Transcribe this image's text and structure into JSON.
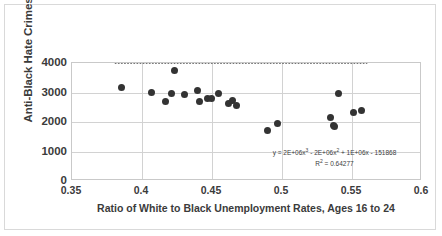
{
  "chart_data": {
    "type": "scatter",
    "title": "",
    "xlabel": "Ratio of White to Black Unemployment Rates, Ages 16 to 24",
    "ylabel": "Anti-Black Hate Crimes",
    "xlim": [
      0.35,
      0.6
    ],
    "ylim": [
      0,
      4000
    ],
    "xticks": [
      "0.35",
      "0.4",
      "0.45",
      "0.5",
      "0.55",
      "0.6"
    ],
    "xtick_values": [
      0.35,
      0.4,
      0.45,
      0.5,
      0.55,
      0.6
    ],
    "yticks": [
      "0",
      "1000",
      "2000",
      "3000",
      "4000"
    ],
    "ytick_values": [
      0,
      1000,
      2000,
      3000,
      4000
    ],
    "grid": true,
    "legend": "none",
    "marker_color": "#333333",
    "trendline_color": "#404040",
    "trendline_style": "dotted",
    "points": [
      {
        "x": 0.385,
        "y": 3160
      },
      {
        "x": 0.407,
        "y": 3000
      },
      {
        "x": 0.417,
        "y": 2690
      },
      {
        "x": 0.421,
        "y": 2950
      },
      {
        "x": 0.4235,
        "y": 3730
      },
      {
        "x": 0.43,
        "y": 2945
      },
      {
        "x": 0.4395,
        "y": 3060
      },
      {
        "x": 0.441,
        "y": 2705
      },
      {
        "x": 0.4465,
        "y": 2810
      },
      {
        "x": 0.4495,
        "y": 2800
      },
      {
        "x": 0.4545,
        "y": 2980
      },
      {
        "x": 0.4615,
        "y": 2625
      },
      {
        "x": 0.4645,
        "y": 2745
      },
      {
        "x": 0.4675,
        "y": 2545
      },
      {
        "x": 0.4895,
        "y": 1700
      },
      {
        "x": 0.4965,
        "y": 1945
      },
      {
        "x": 0.5345,
        "y": 2160
      },
      {
        "x": 0.5365,
        "y": 1880
      },
      {
        "x": 0.5375,
        "y": 1840
      },
      {
        "x": 0.5405,
        "y": 2975
      },
      {
        "x": 0.551,
        "y": 2310
      },
      {
        "x": 0.5565,
        "y": 2390
      }
    ],
    "annotations": {
      "equation": "y = 2E+06x³ - 2E+06x² + 1E+06x - 151868",
      "equation_parts": {
        "lead": "y = 2E+06x",
        "exp1": "3",
        "mid": " - 2E+06x",
        "exp2": "2",
        "tail": " + 1E+06x - 151868"
      },
      "r_squared_label": "R",
      "r_squared_exp": "2",
      "r_squared_value": " = 0.64277"
    },
    "trendline": {
      "type": "polynomial",
      "order": 3,
      "coefficients": [
        2000000,
        -2000000,
        1000000,
        -151868
      ],
      "r_squared": 0.64277
    }
  }
}
